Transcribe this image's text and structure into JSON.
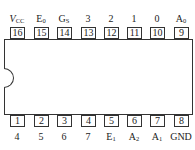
{
  "chip": {
    "top_pins": [
      {
        "number": "16",
        "label": "V",
        "sub": "CC",
        "italic": true
      },
      {
        "number": "15",
        "label": "E",
        "sub": "0"
      },
      {
        "number": "14",
        "label": "G",
        "sub": "S"
      },
      {
        "number": "13",
        "label": "3",
        "sub": ""
      },
      {
        "number": "12",
        "label": "2",
        "sub": ""
      },
      {
        "number": "11",
        "label": "1",
        "sub": ""
      },
      {
        "number": "10",
        "label": "0",
        "sub": ""
      },
      {
        "number": "9",
        "label": "A",
        "sub": "0"
      }
    ],
    "bottom_pins": [
      {
        "number": "1",
        "label": "4",
        "sub": ""
      },
      {
        "number": "2",
        "label": "5",
        "sub": ""
      },
      {
        "number": "3",
        "label": "6",
        "sub": ""
      },
      {
        "number": "4",
        "label": "7",
        "sub": ""
      },
      {
        "number": "5",
        "label": "E",
        "sub": "1"
      },
      {
        "number": "6",
        "label": "A",
        "sub": "2"
      },
      {
        "number": "7",
        "label": "A",
        "sub": "1"
      },
      {
        "number": "8",
        "label": "GND",
        "sub": ""
      }
    ]
  }
}
